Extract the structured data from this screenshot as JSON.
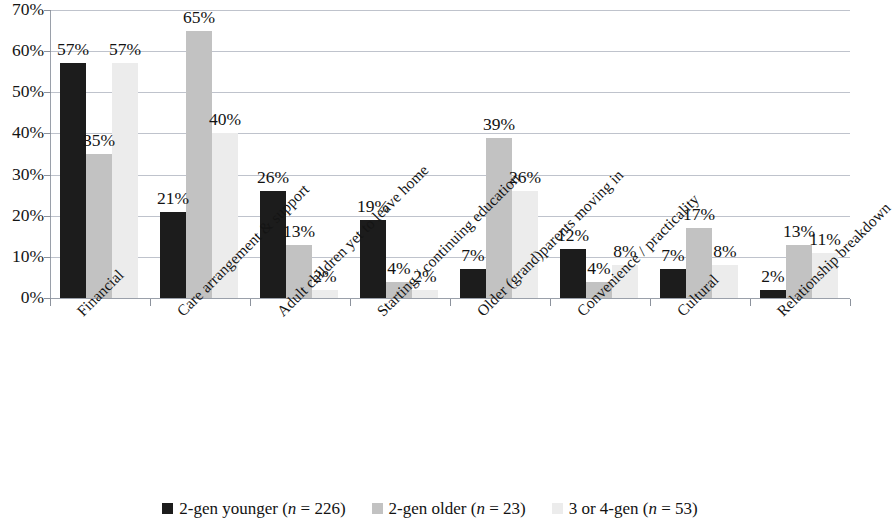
{
  "chart_data": {
    "type": "bar",
    "title": "",
    "subtitle": "",
    "xlabel": "",
    "ylabel": "",
    "ylim": [
      0,
      70
    ],
    "ytick_labels": [
      "0%",
      "10%",
      "20%",
      "30%",
      "40%",
      "50%",
      "60%",
      "70%"
    ],
    "ytick_values": [
      0,
      10,
      20,
      30,
      40,
      50,
      60,
      70
    ],
    "grid": "horizontal",
    "legend_position": "bottom",
    "value_suffix": "%",
    "categories": [
      "Financial",
      "Care arrangement & support",
      "Adult children yet to leave home",
      "Starting / continuing education",
      "Older (grand)parents moving in",
      "Convenience / practicality",
      "Cultural",
      "Relationship breakdown"
    ],
    "series": [
      {
        "name": "2-gen younger (n = 226)",
        "color": "#1c1c1c",
        "values": [
          57,
          21,
          26,
          19,
          7,
          12,
          7,
          2
        ],
        "labels": [
          "57%",
          "21%",
          "26%",
          "19%",
          "7%",
          "12%",
          "7%",
          "2%"
        ]
      },
      {
        "name": "2-gen older (n = 23)",
        "color": "#c2c2c2",
        "values": [
          35,
          65,
          13,
          4,
          39,
          4,
          17,
          13
        ],
        "labels": [
          "35%",
          "65%",
          "13%",
          "4%",
          "39%",
          "4%",
          "17%",
          "13%"
        ]
      },
      {
        "name": "3 or 4-gen (n = 53)",
        "color": "#ececec",
        "values": [
          57,
          40,
          2,
          2,
          26,
          8,
          8,
          11
        ],
        "labels": [
          "57%",
          "40%",
          "2%",
          "2%",
          "26%",
          "8%",
          "8%",
          "11%"
        ]
      }
    ]
  },
  "legend": {
    "items": [
      {
        "label_prefix": "2-gen younger (",
        "italic": "n",
        "label_suffix": " = 226)",
        "swatch": "s0"
      },
      {
        "label_prefix": "2-gen older (",
        "italic": "n",
        "label_suffix": " = 23)",
        "swatch": "s1"
      },
      {
        "label_prefix": "3 or 4-gen (",
        "italic": "n",
        "label_suffix": " = 53)",
        "swatch": "s2"
      }
    ]
  }
}
